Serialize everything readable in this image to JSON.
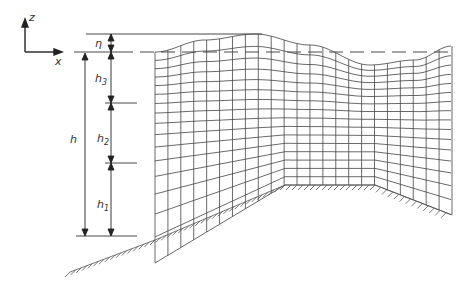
{
  "figure": {
    "axes": {
      "z_label": "z",
      "x_label": "x"
    },
    "labels": {
      "eta": "η",
      "h": "h",
      "h1": "h",
      "h1_sub": "1",
      "h2": "h",
      "h2_sub": "2",
      "h3": "h",
      "h3_sub": "3"
    },
    "colors": {
      "line": "#333333",
      "grid": "#444444",
      "background": "#ffffff"
    },
    "grid": {
      "columns": 23,
      "rows": 16
    }
  }
}
